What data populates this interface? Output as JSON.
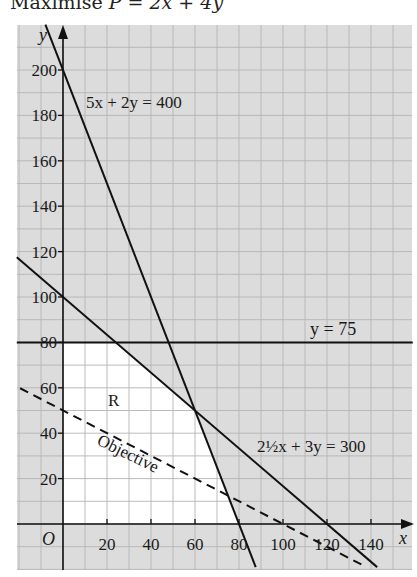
{
  "title": {
    "prefix": "Maximise ",
    "var": "P",
    "expr": " = 2x + 4y"
  },
  "colors": {
    "grid_bg": "#dcdcdc",
    "grid_line": "#b4b4b4",
    "feasible_region": "#ffffff",
    "line": "#111111"
  },
  "chart_data": {
    "type": "line",
    "title": "Maximise P = 2x + 4y",
    "xlabel": "x",
    "ylabel": "y",
    "origin_label": "O",
    "xlim": [
      -21,
      159
    ],
    "ylim": [
      -20,
      220
    ],
    "x_ticks": [
      20,
      40,
      60,
      80,
      100,
      120,
      140
    ],
    "y_ticks": [
      20,
      40,
      60,
      80,
      100,
      120,
      140,
      160,
      180,
      200
    ],
    "grid": true,
    "grid_step": 10,
    "series": [
      {
        "name": "5x + 2y = 400",
        "style": "solid",
        "points": [
          [
            -8,
            220
          ],
          [
            87.6,
            -19
          ]
        ],
        "intercepts": {
          "x": 80,
          "y": 200
        }
      },
      {
        "name": "y = 75",
        "style": "solid",
        "note": "drawn at y = 80 on the axis",
        "points": [
          [
            -21,
            80
          ],
          [
            159,
            80
          ]
        ]
      },
      {
        "name": "2½x + 3y = 300",
        "style": "solid",
        "points": [
          [
            -21,
            117.5
          ],
          [
            142.8,
            -19
          ]
        ],
        "intercepts": {
          "x": 120,
          "y": 100
        }
      },
      {
        "name": "Objective",
        "style": "dashed",
        "equation": "2x + 4y = 200",
        "points": [
          [
            -19.5,
            59.8
          ],
          [
            138,
            -19
          ]
        ],
        "intercepts": {
          "x": 100,
          "y": 50
        }
      }
    ],
    "region": {
      "label": "R",
      "vertices": [
        [
          0,
          0
        ],
        [
          80,
          0
        ],
        [
          60,
          50
        ],
        [
          24,
          80
        ],
        [
          0,
          80
        ]
      ]
    },
    "annotations": [
      {
        "text": "5x + 2y = 400",
        "at": [
          10,
          190
        ]
      },
      {
        "text": "y = 75",
        "at": [
          118,
          85
        ]
      },
      {
        "text": "2½x + 3y = 300",
        "at": [
          90,
          42
        ]
      },
      {
        "text": "R",
        "at": [
          24,
          60
        ]
      },
      {
        "text": "Objective",
        "at": [
          20,
          28
        ],
        "rotation": -26
      }
    ]
  }
}
